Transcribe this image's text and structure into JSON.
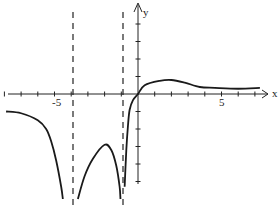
{
  "chart_data": {
    "type": "line",
    "title": "",
    "xlabel": "x",
    "ylabel": "y",
    "xlim": [
      -8,
      7.5
    ],
    "ylim": [
      -6,
      5
    ],
    "x_ticks_labeled": [
      {
        "value": -5,
        "label": "-5"
      },
      {
        "value": 5,
        "label": "5"
      }
    ],
    "x_tick_step": 1,
    "y_tick_step": 1,
    "grid": false,
    "legend": null,
    "vertical_asymptotes": [
      -4,
      -1
    ],
    "horizontal_asymptote_right": 0.3,
    "series": [
      {
        "name": "branch-left (x < -4)",
        "points": [
          [
            -7.9,
            -1
          ],
          [
            -7,
            -1.1
          ],
          [
            -6,
            -1.5
          ],
          [
            -5.5,
            -2
          ],
          [
            -5.2,
            -2.7
          ],
          [
            -4.9,
            -3.8
          ],
          [
            -4.6,
            -5.3
          ],
          [
            -4.5,
            -6
          ]
        ]
      },
      {
        "name": "branch-middle (-4 < x < -1)",
        "points": [
          [
            -3.6,
            -6
          ],
          [
            -3.2,
            -4.7
          ],
          [
            -2.7,
            -3.7
          ],
          [
            -2,
            -2.9
          ],
          [
            -1.6,
            -3.2
          ],
          [
            -1.3,
            -4.1
          ],
          [
            -1.1,
            -5.3
          ],
          [
            -1.05,
            -6
          ]
        ]
      },
      {
        "name": "branch-right (x > -1)",
        "points": [
          [
            -0.8,
            -5.3
          ],
          [
            -0.7,
            -3.2
          ],
          [
            -0.6,
            -1.8
          ],
          [
            -0.5,
            -0.9
          ],
          [
            -0.3,
            -0.35
          ],
          [
            0,
            0
          ],
          [
            0.4,
            0.5
          ],
          [
            1.3,
            0.75
          ],
          [
            2,
            0.8
          ],
          [
            2.8,
            0.65
          ],
          [
            3.7,
            0.4
          ],
          [
            4.6,
            0.35
          ],
          [
            6,
            0.3
          ],
          [
            7.3,
            0.35
          ]
        ]
      }
    ],
    "annotations": []
  },
  "axes": {
    "x_label": "x",
    "y_label": "y",
    "tick_label_neg5": "-5",
    "tick_label_pos5": "5"
  }
}
